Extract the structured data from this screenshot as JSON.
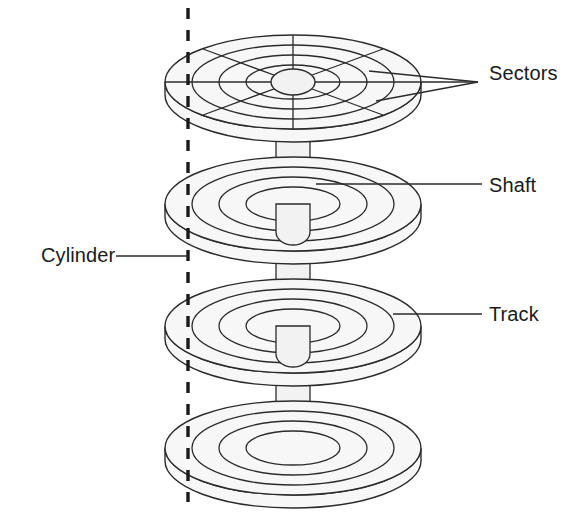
{
  "figure": {
    "type": "technical-line-diagram",
    "canvas": {
      "width": 569,
      "height": 516
    },
    "background_color": "#ffffff",
    "line_color": "#2b2b2b",
    "platter_fill": "#f7f7f7",
    "shaft_fill": "#f2f2f2",
    "hub_fill": "#f2f2f2",
    "text_color": "#1a1a1a"
  },
  "labels": {
    "sectors": "Sectors",
    "shaft": "Shaft",
    "track": "Track",
    "cylinder": "Cylinder"
  },
  "geometry": {
    "center_x": 293,
    "platter_radius_x": 128,
    "platter_radius_y": 47,
    "platter_rim_depth": 13,
    "track_radii_x": [
      128,
      101,
      74,
      47
    ],
    "track_radii_y": [
      47,
      37,
      27,
      17
    ],
    "hub_radius_x": 22,
    "hub_radius_y": 13,
    "sector_count": 8,
    "platter_count": 4,
    "platter_center_y": [
      82,
      204,
      326,
      448
    ],
    "shaft_width": 34,
    "cylinder_dash_x": 188,
    "cylinder_dash_y_top": 8,
    "cylinder_dash_y_bottom": 502
  },
  "leaders": {
    "sectors_point": {
      "x": 478,
      "y": 82
    },
    "sectors_anchors": [
      {
        "x": 369,
        "y": 71
      },
      {
        "x": 420,
        "y": 82
      },
      {
        "x": 376,
        "y": 101
      }
    ],
    "shaft_line": {
      "x1": 316,
      "y1": 184,
      "x2": 482,
      "y2": 184
    },
    "track_line": {
      "x1": 393,
      "y1": 314,
      "x2": 482,
      "y2": 314
    },
    "cylinder_line": {
      "x1": 116,
      "y1": 256,
      "x2": 188,
      "y2": 256
    }
  }
}
